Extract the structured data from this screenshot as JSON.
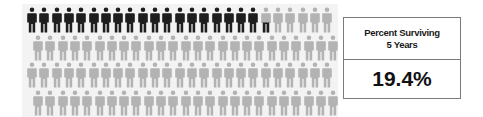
{
  "chart_data": {
    "type": "pictogram",
    "title": "Percent Surviving 5 Years",
    "total_icons": 100,
    "rows": 4,
    "icons_per_row": 25,
    "filled_value": 19.4,
    "filled_icons_full": 19,
    "partial_icon_fraction": 0.4,
    "unit": "%",
    "colors": {
      "filled": "#1e1e1e",
      "empty": "#b3b3b3"
    }
  },
  "stat": {
    "label_line1": "Percent Surviving",
    "label_line2": "5 Years",
    "value": "19.4%"
  }
}
